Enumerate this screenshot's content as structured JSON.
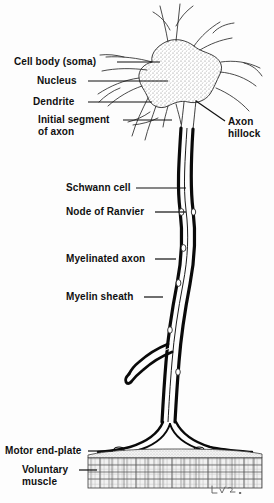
{
  "figure": {
    "background_color": "#fdfdfd",
    "ink_color": "#101010",
    "signature": "L.V.L."
  },
  "labels": [
    {
      "id": "cell-body",
      "text": "Cell body (soma)",
      "line2": "",
      "x": 14,
      "y": 56,
      "align": "left",
      "leader": {
        "x1": 117,
        "y1": 62,
        "x2": 160,
        "y2": 62
      }
    },
    {
      "id": "nucleus",
      "text": "Nucleus",
      "line2": "",
      "x": 37,
      "y": 75,
      "align": "left",
      "leader": {
        "x1": 88,
        "y1": 81,
        "x2": 168,
        "y2": 81
      }
    },
    {
      "id": "dendrite",
      "text": "Dendrite",
      "line2": "",
      "x": 33,
      "y": 96,
      "align": "left",
      "leader": {
        "x1": 88,
        "y1": 102,
        "x2": 152,
        "y2": 102
      }
    },
    {
      "id": "initial-segment",
      "text": "Initial segment",
      "line2": "of axon",
      "x": 38,
      "y": 114,
      "align": "left",
      "leader": {
        "x1": 123,
        "y1": 120,
        "x2": 172,
        "y2": 120
      }
    },
    {
      "id": "axon-hillock",
      "text": "Axon",
      "line2": "hillock",
      "x": 228,
      "y": 116,
      "align": "left",
      "leader": {
        "x1": 196,
        "y1": 101,
        "x2": 225,
        "y2": 121
      }
    },
    {
      "id": "schwann-cell",
      "text": "Schwann cell",
      "line2": "",
      "x": 66,
      "y": 182,
      "align": "left",
      "leader": {
        "x1": 136,
        "y1": 188,
        "x2": 186,
        "y2": 188
      }
    },
    {
      "id": "node-of-ranvier",
      "text": "Node of Ranvier",
      "line2": "",
      "x": 66,
      "y": 206,
      "align": "left",
      "leader": {
        "x1": 155,
        "y1": 212,
        "x2": 186,
        "y2": 212
      }
    },
    {
      "id": "myelinated-axon",
      "text": "Myelinated axon",
      "line2": "",
      "x": 66,
      "y": 253,
      "align": "left",
      "leader": {
        "x1": 155,
        "y1": 259,
        "x2": 176,
        "y2": 259
      }
    },
    {
      "id": "myelin-sheath",
      "text": "Myelin sheath",
      "line2": "",
      "x": 66,
      "y": 291,
      "align": "left",
      "leader": {
        "x1": 144,
        "y1": 297,
        "x2": 163,
        "y2": 297
      }
    },
    {
      "id": "motor-end-plate",
      "text": "Motor end-plate",
      "line2": "",
      "x": 5,
      "y": 445,
      "align": "left",
      "leader": {
        "x1": 88,
        "y1": 451,
        "x2": 113,
        "y2": 451
      }
    },
    {
      "id": "voluntary-muscle",
      "text": "Voluntary",
      "line2": "muscle",
      "x": 22,
      "y": 464,
      "align": "left",
      "leader": {
        "x1": 79,
        "y1": 470,
        "x2": 97,
        "y2": 470
      }
    }
  ],
  "anatomy": {
    "soma": {
      "name": "cell body (soma)",
      "center_x": 178,
      "center_y": 80,
      "stipple": true
    },
    "nucleus": {
      "name": "nucleus",
      "center_x": 173,
      "center_y": 79,
      "radius": 7,
      "nucleolus_radius": 2.5
    },
    "dendrite_count": 9,
    "axon": {
      "name": "myelinated axon",
      "starts_y": 128,
      "ends_y": 440,
      "sheath_thickness": 3
    },
    "nodes_of_ranvier": [
      212,
      248,
      283,
      330,
      372
    ],
    "muscle": {
      "name": "voluntary muscle",
      "top": 452,
      "bottom": 488,
      "left": 88,
      "right": 262,
      "striations": true
    }
  }
}
